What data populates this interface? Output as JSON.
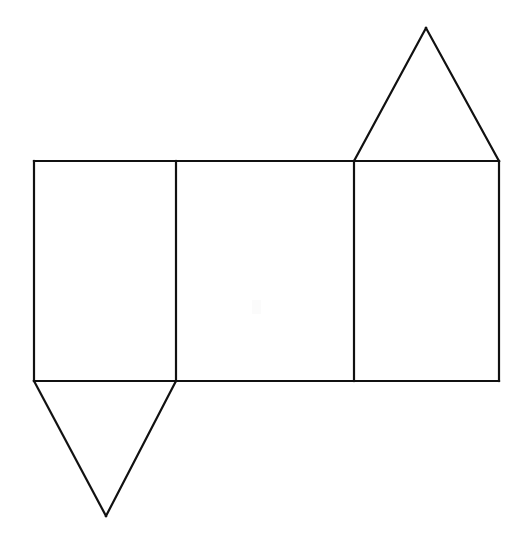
{
  "figure": {
    "background_color": "#ffffff",
    "stroke_color": "#111111",
    "stroke_width": 2.2,
    "canvas": {
      "width": 527,
      "height": 554
    },
    "geometry": {
      "rect_top_y": 161,
      "rect_bottom_y": 381,
      "rect_left_x": 34,
      "rect_right_x": 499,
      "divider_1_x": 176,
      "divider_2_x": 354,
      "top_triangle_apex": {
        "x": 426,
        "y": 28
      },
      "bottom_triangle_apex": {
        "x": 106,
        "y": 516
      }
    },
    "faces": [
      {
        "name": "rectangle-face-left",
        "shape": "rectangle",
        "points": "34,161 176,161 176,381 34,381"
      },
      {
        "name": "rectangle-face-middle",
        "shape": "rectangle",
        "points": "176,161 354,161 354,381 176,381"
      },
      {
        "name": "rectangle-face-right",
        "shape": "rectangle",
        "points": "354,161 499,161 499,381 354,381"
      },
      {
        "name": "triangle-face-top",
        "shape": "triangle",
        "points": "354,161 426,28 499,161"
      },
      {
        "name": "triangle-face-bottom",
        "shape": "triangle",
        "points": "34,381 106,516 176,381"
      }
    ],
    "edges": [
      {
        "name": "edge-rect-outline-top",
        "points": "34,161 499,161"
      },
      {
        "name": "edge-rect-outline-bottom",
        "points": "34,381 499,381"
      },
      {
        "name": "edge-rect-outline-left",
        "points": "34,161 34,381"
      },
      {
        "name": "edge-rect-outline-right",
        "points": "499,161 499,381"
      },
      {
        "name": "edge-fold-divider-1",
        "points": "176,161 176,381"
      },
      {
        "name": "edge-fold-divider-2",
        "points": "354,161 354,381"
      },
      {
        "name": "edge-top-triangle-left",
        "points": "354,161 426,28"
      },
      {
        "name": "edge-top-triangle-right",
        "points": "426,28 499,161"
      },
      {
        "name": "edge-bottom-triangle-left",
        "points": "34,381 106,516"
      },
      {
        "name": "edge-bottom-triangle-right",
        "points": "106,516 176,381"
      }
    ]
  }
}
